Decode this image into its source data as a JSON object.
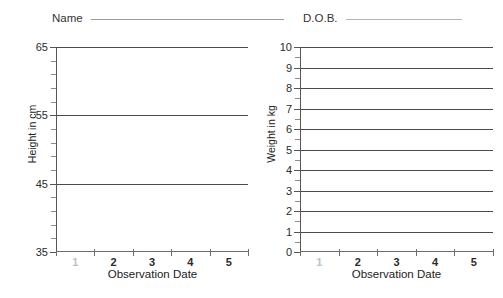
{
  "form": {
    "name": {
      "label": "Name",
      "value": "",
      "placeholder": ""
    },
    "dob": {
      "label": "D.O.B.",
      "value": "",
      "placeholder": ""
    }
  },
  "charts": [
    {
      "id": "height",
      "ylabel": "Height in cm",
      "xlabel": "Observation Date"
    },
    {
      "id": "weight",
      "ylabel": "Weight in kg",
      "xlabel": "Observation Date"
    }
  ],
  "chart_data": [
    {
      "type": "line",
      "title": "",
      "xlabel": "Observation Date",
      "ylabel": "Height in cm",
      "ylim": [
        35,
        65
      ],
      "xlim": [
        0,
        5
      ],
      "yticks_major": [
        35,
        45,
        55,
        65
      ],
      "yticklabels": [
        "35",
        "45",
        "55",
        "65"
      ],
      "ytick_minor_step": 2,
      "gridlines_y": [
        45,
        55,
        65
      ],
      "grid": true,
      "legend": "none",
      "xticklabels": [
        "1",
        "2",
        "3",
        "4",
        "5"
      ],
      "series": [
        {
          "name": "Height",
          "x": [],
          "values": []
        }
      ]
    },
    {
      "type": "line",
      "title": "",
      "xlabel": "Observation Date",
      "ylabel": "Weight in kg",
      "ylim": [
        0,
        10
      ],
      "xlim": [
        0,
        5
      ],
      "yticks_major": [
        0,
        1,
        2,
        3,
        4,
        5,
        6,
        7,
        8,
        9,
        10
      ],
      "yticklabels": [
        "0",
        "1",
        "2",
        "3",
        "4",
        "5",
        "6",
        "7",
        "8",
        "9",
        "10"
      ],
      "ytick_minor_step": 0.5,
      "gridlines_y": [
        1,
        2,
        3,
        4,
        5,
        6,
        7,
        8,
        9,
        10
      ],
      "grid": true,
      "legend": "none",
      "xticklabels": [
        "1",
        "2",
        "3",
        "4",
        "5"
      ],
      "series": [
        {
          "name": "Weight",
          "x": [],
          "values": []
        }
      ]
    }
  ]
}
